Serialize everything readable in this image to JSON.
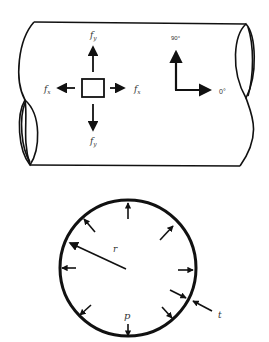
{
  "diagram": {
    "pipe": {
      "stress_element": {
        "label_top": "f",
        "label_top_sub": "y",
        "label_bottom": "f",
        "label_bottom_sub": "y",
        "label_left": "f",
        "label_left_sub": "x",
        "label_right": "f",
        "label_right_sub": "x"
      },
      "orientation": {
        "vertical_label": "90°",
        "horizontal_label": "0°"
      }
    },
    "cross_section": {
      "radius_label": "r",
      "pressure_label": "p",
      "thickness_label": "t"
    },
    "colors": {
      "line": "#111111",
      "background": "#ffffff"
    }
  }
}
